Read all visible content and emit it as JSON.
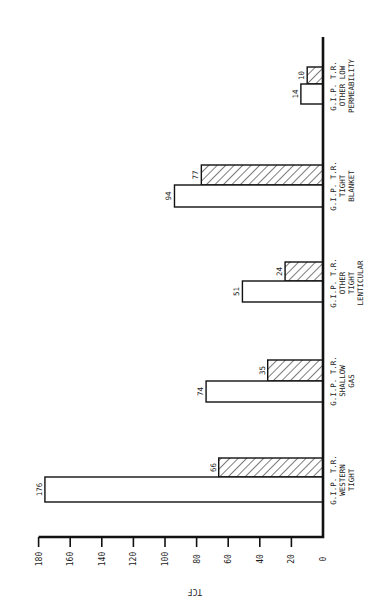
{
  "chart_data": {
    "type": "bar",
    "orientation": "rotated-90 (bars extend leftward from baseline; page printed sideways)",
    "title": "",
    "xlabel": "",
    "ylabel": "TCF",
    "ylim": [
      0,
      180
    ],
    "yticks": [
      0,
      20,
      40,
      60,
      80,
      100,
      120,
      140,
      160,
      180
    ],
    "grid": false,
    "legend": null,
    "categories": [
      [
        "G.I.P. T.R.",
        "WESTERN",
        "TIGHT"
      ],
      [
        "G.I.P. T.R.",
        "SHALLOW",
        "GAS"
      ],
      [
        "G.I.P. T.R.",
        "OTHER",
        "TIGHT",
        "LENTICULAR"
      ],
      [
        "G.I.P. T.R.",
        "TIGHT",
        "BLANKET"
      ],
      [
        "G.I.P. T.R.",
        "OTHER LOW",
        "PERMEABILITY"
      ]
    ],
    "series": [
      {
        "name": "open bar",
        "pattern": "none",
        "values": [
          176,
          74,
          51,
          94,
          14
        ]
      },
      {
        "name": "hatched bar",
        "pattern": "diagonal-hatch",
        "values": [
          66,
          35,
          24,
          77,
          10
        ]
      }
    ]
  },
  "axis": {
    "title": "TCF",
    "tick_labels": [
      "180",
      "160",
      "140",
      "120",
      "100",
      "80",
      "60",
      "40",
      "20",
      "0"
    ]
  },
  "colors": {
    "ink": "#111111",
    "paper": "#ffffff"
  }
}
